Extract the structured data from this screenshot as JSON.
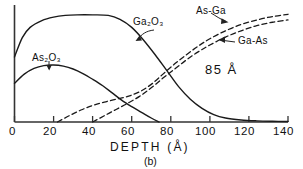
{
  "figure": {
    "caption": "(b)",
    "annotation": "85 Å"
  },
  "axes": {
    "x_title": "DEPTH  (Å)",
    "x_ticks": [
      "0",
      "20",
      "40",
      "60",
      "80",
      "100",
      "120",
      "140"
    ],
    "y_ticks": []
  },
  "labels": {
    "ga2o3": "Ga₂O₃",
    "as2o3": "As₂O₃",
    "asga": "As-Ga",
    "gaas": "Ga-As"
  },
  "chart_data": {
    "type": "line",
    "title": "",
    "subtitle": "(b)",
    "xlabel": "DEPTH  (Å)",
    "ylabel": "",
    "xlim": [
      0,
      140
    ],
    "ylim": [
      0,
      1
    ],
    "grid": false,
    "legend": "inline-annotations",
    "xticks": [
      0,
      20,
      40,
      60,
      80,
      100,
      120,
      140
    ],
    "yticks": [],
    "annotations": [
      {
        "text": "85 Å",
        "x": 103,
        "y": 0.47
      },
      {
        "text": "(b)",
        "x": 70,
        "y": -0.33
      }
    ],
    "series": [
      {
        "name": "Ga₂O₃",
        "style": "solid",
        "color": "#1a1a1a",
        "x": [
          0,
          4,
          8,
          14,
          20,
          26,
          32,
          40,
          48,
          54,
          60,
          66,
          72,
          78,
          84,
          90,
          96,
          102,
          108,
          116,
          124,
          132,
          140
        ],
        "y": [
          0.57,
          0.74,
          0.83,
          0.89,
          0.92,
          0.935,
          0.94,
          0.94,
          0.935,
          0.9,
          0.83,
          0.72,
          0.59,
          0.45,
          0.31,
          0.2,
          0.12,
          0.065,
          0.035,
          0.018,
          0.01,
          0.006,
          0.004
        ]
      },
      {
        "name": "As₂O₃",
        "style": "solid",
        "color": "#1a1a1a",
        "x": [
          0,
          5,
          10,
          15,
          20,
          25,
          30,
          35,
          40,
          45,
          50,
          55,
          60,
          65,
          70,
          74
        ],
        "y": [
          0.34,
          0.42,
          0.47,
          0.495,
          0.5,
          0.49,
          0.465,
          0.425,
          0.375,
          0.32,
          0.255,
          0.19,
          0.135,
          0.085,
          0.035,
          0.0
        ]
      },
      {
        "name": "As-Ga",
        "style": "dashed",
        "color": "#1a1a1a",
        "x": [
          22,
          28,
          34,
          40,
          46,
          52,
          58,
          64,
          70,
          76,
          82,
          88,
          94,
          100,
          108,
          116,
          124,
          132,
          140
        ],
        "y": [
          0.0,
          0.055,
          0.105,
          0.145,
          0.175,
          0.2,
          0.225,
          0.265,
          0.33,
          0.42,
          0.51,
          0.59,
          0.665,
          0.73,
          0.8,
          0.855,
          0.895,
          0.925,
          0.945
        ]
      },
      {
        "name": "Ga-As",
        "style": "dashed",
        "color": "#1a1a1a",
        "x": [
          40,
          46,
          52,
          58,
          64,
          70,
          76,
          82,
          88,
          94,
          100,
          108,
          116,
          124,
          132,
          140
        ],
        "y": [
          0.0,
          0.055,
          0.11,
          0.165,
          0.225,
          0.3,
          0.385,
          0.465,
          0.545,
          0.615,
          0.675,
          0.745,
          0.8,
          0.845,
          0.875,
          0.895
        ]
      }
    ]
  }
}
